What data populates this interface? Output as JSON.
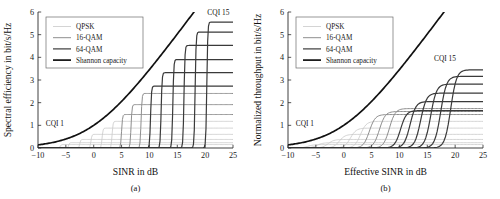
{
  "figure": {
    "panels": [
      {
        "id": "a",
        "caption": "(a)",
        "xlabel": "SINR in dB",
        "ylabel": "Spectral efficiency in bit/s/Hz",
        "annotations": [
          {
            "text": "CQI 1",
            "x": -8.6,
            "y": 0.95
          },
          {
            "text": "CQI 15",
            "x": 20.4,
            "y": 5.85
          }
        ]
      },
      {
        "id": "b",
        "caption": "(b)",
        "xlabel": "Effective SINR in dB",
        "ylabel": "Normalized throughput in bit/s/Hz",
        "annotations": [
          {
            "text": "CQI 1",
            "x": -8.6,
            "y": 0.95
          },
          {
            "text": "CQI 15",
            "x": 16.2,
            "y": 3.85
          }
        ]
      }
    ],
    "legend": {
      "entries": [
        {
          "label": "QPSK",
          "color": "#c9c9c9",
          "width": 0.8
        },
        {
          "label": "16-QAM",
          "color": "#8e8e8e",
          "width": 1.0
        },
        {
          "label": "64-QAM",
          "color": "#3a3a3a",
          "width": 1.2
        },
        {
          "label": "Shannon capacity",
          "color": "#111111",
          "width": 1.7
        }
      ]
    }
  },
  "chart_data": [
    {
      "type": "line",
      "panel": "a",
      "title": "",
      "xlabel": "SINR in dB",
      "ylabel": "Spectral efficiency in bit/s/Hz",
      "xlim": [
        -10,
        25
      ],
      "ylim": [
        0,
        6
      ],
      "xticks": [
        -10,
        -5,
        0,
        5,
        10,
        15,
        20,
        25
      ],
      "xticklabels": [
        "−10",
        "−5",
        "0",
        "5",
        "10",
        "15",
        "20",
        "25"
      ],
      "yticks": [
        0,
        1,
        2,
        3,
        4,
        5,
        6
      ],
      "yticklabels": [
        "0",
        "1",
        "2",
        "3",
        "4",
        "5",
        "6"
      ],
      "grid": false,
      "legend_position": "upper-left",
      "shannon": {
        "name": "Shannon capacity",
        "formula": "log2(1+10^(SINR/10))",
        "color": "#111111",
        "width": 1.7,
        "points": [
          {
            "x": -10,
            "y": 0.137
          },
          {
            "x": -8,
            "y": 0.211
          },
          {
            "x": -6,
            "y": 0.32
          },
          {
            "x": -4,
            "y": 0.474
          },
          {
            "x": -2,
            "y": 0.687
          },
          {
            "x": 0,
            "y": 1.0
          },
          {
            "x": 2,
            "y": 1.297
          },
          {
            "x": 4,
            "y": 1.72
          },
          {
            "x": 6,
            "y": 2.217
          },
          {
            "x": 8,
            "y": 2.777
          },
          {
            "x": 10,
            "y": 3.459
          },
          {
            "x": 12,
            "y": 4.047
          },
          {
            "x": 14,
            "y": 4.715
          },
          {
            "x": 16,
            "y": 5.403
          },
          {
            "x": 17.8,
            "y": 6.0
          }
        ]
      },
      "series": [
        {
          "name": "CQI 1",
          "modulation": "QPSK",
          "efficiency": 0.1523,
          "switch_x": -6.0,
          "color": "#c9c9c9",
          "width": 0.8
        },
        {
          "name": "CQI 2",
          "modulation": "QPSK",
          "efficiency": 0.2344,
          "switch_x": -4.5,
          "color": "#c9c9c9",
          "width": 0.8
        },
        {
          "name": "CQI 3",
          "modulation": "QPSK",
          "efficiency": 0.377,
          "switch_x": -2.5,
          "color": "#c9c9c9",
          "width": 0.8
        },
        {
          "name": "CQI 4",
          "modulation": "QPSK",
          "efficiency": 0.6016,
          "switch_x": -0.5,
          "color": "#c9c9c9",
          "width": 0.8
        },
        {
          "name": "CQI 5",
          "modulation": "QPSK",
          "efficiency": 0.877,
          "switch_x": 1.5,
          "color": "#c9c9c9",
          "width": 0.8
        },
        {
          "name": "CQI 6",
          "modulation": "QPSK",
          "efficiency": 1.1758,
          "switch_x": 3.3,
          "color": "#c9c9c9",
          "width": 0.8
        },
        {
          "name": "CQI 7",
          "modulation": "16-QAM",
          "efficiency": 1.4766,
          "switch_x": 5.0,
          "color": "#8e8e8e",
          "width": 1.0
        },
        {
          "name": "CQI 8",
          "modulation": "16-QAM",
          "efficiency": 1.9141,
          "switch_x": 6.7,
          "color": "#8e8e8e",
          "width": 1.0
        },
        {
          "name": "CQI 9",
          "modulation": "16-QAM",
          "efficiency": 2.4063,
          "switch_x": 8.5,
          "color": "#8e8e8e",
          "width": 1.0
        },
        {
          "name": "CQI 10",
          "modulation": "64-QAM",
          "efficiency": 2.7305,
          "switch_x": 10.2,
          "color": "#3a3a3a",
          "width": 1.2
        },
        {
          "name": "CQI 11",
          "modulation": "64-QAM",
          "efficiency": 3.3223,
          "switch_x": 12.1,
          "color": "#3a3a3a",
          "width": 1.2
        },
        {
          "name": "CQI 12",
          "modulation": "64-QAM",
          "efficiency": 3.9023,
          "switch_x": 14.2,
          "color": "#3a3a3a",
          "width": 1.2
        },
        {
          "name": "CQI 13",
          "modulation": "64-QAM",
          "efficiency": 4.5234,
          "switch_x": 16.2,
          "color": "#3a3a3a",
          "width": 1.2
        },
        {
          "name": "CQI 14",
          "modulation": "64-QAM",
          "efficiency": 5.1152,
          "switch_x": 18.2,
          "color": "#3a3a3a",
          "width": 1.2
        },
        {
          "name": "CQI 15",
          "modulation": "64-QAM",
          "efficiency": 5.5547,
          "switch_x": 20.3,
          "color": "#3a3a3a",
          "width": 1.2
        }
      ],
      "style": {
        "transition": "step",
        "transition_width_db": 0.35
      }
    },
    {
      "type": "line",
      "panel": "b",
      "title": "",
      "xlabel": "Effective SINR in dB",
      "ylabel": "Normalized throughput in bit/s/Hz",
      "xlim": [
        -10,
        25
      ],
      "ylim": [
        0,
        6
      ],
      "xticks": [
        -10,
        -5,
        0,
        5,
        10,
        15,
        20,
        25
      ],
      "xticklabels": [
        "−10",
        "−5",
        "0",
        "5",
        "10",
        "15",
        "20",
        "25"
      ],
      "yticks": [
        0,
        1,
        2,
        3,
        4,
        5,
        6
      ],
      "yticklabels": [
        "0",
        "1",
        "2",
        "3",
        "4",
        "5",
        "6"
      ],
      "grid": false,
      "legend_position": "upper-left",
      "shannon": {
        "name": "Shannon capacity",
        "formula": "log2(1+10^(SINR/10))",
        "color": "#111111",
        "width": 1.7,
        "points": [
          {
            "x": -10,
            "y": 0.137
          },
          {
            "x": -8,
            "y": 0.211
          },
          {
            "x": -6,
            "y": 0.32
          },
          {
            "x": -4,
            "y": 0.474
          },
          {
            "x": -2,
            "y": 0.687
          },
          {
            "x": 0,
            "y": 1.0
          },
          {
            "x": 2,
            "y": 1.297
          },
          {
            "x": 4,
            "y": 1.72
          },
          {
            "x": 6,
            "y": 2.217
          },
          {
            "x": 8,
            "y": 2.777
          },
          {
            "x": 10,
            "y": 3.459
          },
          {
            "x": 12,
            "y": 4.047
          },
          {
            "x": 14,
            "y": 4.715
          },
          {
            "x": 16,
            "y": 5.403
          },
          {
            "x": 17.8,
            "y": 6.0
          }
        ]
      },
      "series": [
        {
          "name": "CQI 1",
          "modulation": "QPSK",
          "efficiency": 0.1523,
          "switch_x": -6.4,
          "color": "#c9c9c9",
          "width": 0.8
        },
        {
          "name": "CQI 2",
          "modulation": "QPSK",
          "efficiency": 0.2344,
          "switch_x": -4.8,
          "color": "#c9c9c9",
          "width": 0.8
        },
        {
          "name": "CQI 3",
          "modulation": "QPSK",
          "efficiency": 0.377,
          "switch_x": -2.8,
          "color": "#c9c9c9",
          "width": 0.8
        },
        {
          "name": "CQI 4",
          "modulation": "QPSK",
          "efficiency": 0.6016,
          "switch_x": -0.8,
          "color": "#c9c9c9",
          "width": 0.8
        },
        {
          "name": "CQI 5",
          "modulation": "QPSK",
          "efficiency": 0.877,
          "switch_x": 1.2,
          "color": "#c9c9c9",
          "width": 0.8
        },
        {
          "name": "CQI 6",
          "modulation": "QPSK",
          "efficiency": 1.1758,
          "switch_x": 3.0,
          "color": "#c9c9c9",
          "width": 0.8
        },
        {
          "name": "CQI 7",
          "modulation": "16-QAM",
          "efficiency": 1.4766,
          "switch_x": 4.6,
          "color": "#8e8e8e",
          "width": 1.0
        },
        {
          "name": "CQI 8",
          "modulation": "16-QAM",
          "efficiency": 1.61,
          "switch_x": 6.4,
          "color": "#8e8e8e",
          "width": 1.0
        },
        {
          "name": "CQI 9",
          "modulation": "16-QAM",
          "efficiency": 1.74,
          "switch_x": 8.2,
          "color": "#8e8e8e",
          "width": 1.0
        },
        {
          "name": "CQI 10",
          "modulation": "64-QAM",
          "efficiency": 1.65,
          "switch_x": 10.2,
          "color": "#3a3a3a",
          "width": 1.2
        },
        {
          "name": "CQI 11",
          "modulation": "64-QAM",
          "efficiency": 2.05,
          "switch_x": 11.9,
          "color": "#3a3a3a",
          "width": 1.2
        },
        {
          "name": "CQI 12",
          "modulation": "64-QAM",
          "efficiency": 2.42,
          "switch_x": 13.8,
          "color": "#3a3a3a",
          "width": 1.2
        },
        {
          "name": "CQI 13",
          "modulation": "64-QAM",
          "efficiency": 2.82,
          "switch_x": 15.6,
          "color": "#3a3a3a",
          "width": 1.2
        },
        {
          "name": "CQI 14",
          "modulation": "64-QAM",
          "efficiency": 3.16,
          "switch_x": 17.4,
          "color": "#3a3a3a",
          "width": 1.2
        },
        {
          "name": "CQI 15",
          "modulation": "64-QAM",
          "efficiency": 3.45,
          "switch_x": 19.2,
          "color": "#3a3a3a",
          "width": 1.2
        }
      ],
      "style": {
        "transition": "sigmoid",
        "transition_width_db": 2.1
      }
    }
  ]
}
